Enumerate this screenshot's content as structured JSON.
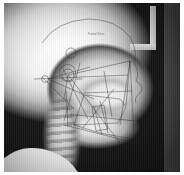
{
  "image": {
    "kind": "lateral-cephalometric-radiograph",
    "orientation": "profile-facing-right",
    "background_color": "#0a0a0a",
    "frame_color": "#ffffff"
  },
  "annotations": {
    "labels": [
      {
        "id": "upper-cranial-label",
        "text": "Frontal Sinus",
        "x": 84,
        "y": 31
      },
      {
        "id": "sella-label",
        "text": "Sella",
        "x": 72,
        "y": 76
      },
      {
        "id": "gonion-label",
        "text": "Gonion",
        "x": 66,
        "y": 112
      }
    ]
  },
  "landmarks": [
    {
      "id": "sella",
      "name": "S",
      "x": 64,
      "y": 72
    },
    {
      "id": "nasion",
      "name": "N",
      "x": 116,
      "y": 62
    },
    {
      "id": "porion",
      "name": "Po",
      "x": 44,
      "y": 76
    },
    {
      "id": "orbitale",
      "name": "Or",
      "x": 104,
      "y": 74
    },
    {
      "id": "anterior-nasal-spine",
      "name": "ANS",
      "x": 116,
      "y": 92
    },
    {
      "id": "posterior-nasal-spine",
      "name": "PNS",
      "x": 84,
      "y": 90
    },
    {
      "id": "point-a",
      "name": "A",
      "x": 114,
      "y": 100
    },
    {
      "id": "point-b",
      "name": "B",
      "x": 110,
      "y": 120
    },
    {
      "id": "pogonion",
      "name": "Pg",
      "x": 116,
      "y": 130
    },
    {
      "id": "menton",
      "name": "Me",
      "x": 110,
      "y": 138
    },
    {
      "id": "gonion",
      "name": "Go",
      "x": 68,
      "y": 122
    },
    {
      "id": "articulare",
      "name": "Ar",
      "x": 62,
      "y": 92
    },
    {
      "id": "basion",
      "name": "Ba",
      "x": 54,
      "y": 90
    }
  ],
  "tracing_lines": [
    {
      "id": "sella-nasion-line",
      "name": "SN plane"
    },
    {
      "id": "frankfort-horizontal",
      "name": "Frankfort horizontal"
    },
    {
      "id": "palatal-plane",
      "name": "Palatal plane"
    },
    {
      "id": "mandibular-plane",
      "name": "Mandibular plane"
    },
    {
      "id": "occlusal-plane",
      "name": "Occlusal plane"
    },
    {
      "id": "facial-plane",
      "name": "Facial plane (N-Pg)"
    },
    {
      "id": "na-point-a-line",
      "name": "N-A line"
    },
    {
      "id": "na-point-b-line",
      "name": "N-B line"
    },
    {
      "id": "ramus-line",
      "name": "Ramus line"
    },
    {
      "id": "upper-incisor-axis",
      "name": "Upper incisor long axis"
    },
    {
      "id": "lower-incisor-axis",
      "name": "Lower incisor long axis"
    },
    {
      "id": "y-axis",
      "name": "Y-axis (S-Gn)"
    }
  ]
}
